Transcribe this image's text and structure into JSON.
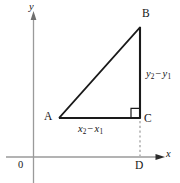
{
  "figure": {
    "type": "geometry-diagram",
    "canvas": {
      "width": 180,
      "height": 183,
      "background": "#ffffff"
    },
    "colors": {
      "axis": "#9a9a9a",
      "triangle": "#1a1a1a",
      "dashed": "#9a9a9a",
      "text": "#141414"
    },
    "axes": {
      "origin_label": "0",
      "x_axis_label": "x",
      "y_axis_label": "y",
      "x_axis_y": 157,
      "y_axis_x": 33.5
    },
    "points": [
      {
        "name": "A",
        "label": "A",
        "x": 60,
        "y": 118
      },
      {
        "name": "B",
        "label": "B",
        "x": 140,
        "y": 27
      },
      {
        "name": "C",
        "label": "C",
        "x": 140,
        "y": 118
      },
      {
        "name": "D",
        "label": "D",
        "x": 140,
        "y": 157
      }
    ],
    "segments": [
      {
        "name": "leg-horizontal",
        "from": "A",
        "to": "C",
        "style": "solid"
      },
      {
        "name": "leg-vertical",
        "from": "B",
        "to": "C",
        "style": "solid"
      },
      {
        "name": "hypotenuse",
        "from": "A",
        "to": "B",
        "style": "solid"
      },
      {
        "name": "drop-to-x-axis",
        "from": "C",
        "to": "D",
        "style": "dashed"
      }
    ],
    "right_angle_at": "C",
    "leg_labels": {
      "horizontal": {
        "var": "x",
        "sub_minuend": "2",
        "op": "−",
        "sub_subtrahend": "1",
        "text": "x2 − x1"
      },
      "vertical": {
        "var": "y",
        "sub_minuend": "2",
        "op": "−",
        "sub_subtrahend": "1",
        "text": "y2 − y1"
      }
    }
  }
}
